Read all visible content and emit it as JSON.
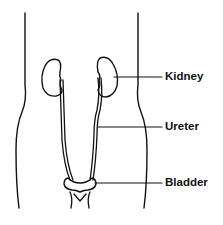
{
  "diagram": {
    "labels": [
      {
        "id": "kidney",
        "text": "Kidney"
      },
      {
        "id": "ureter",
        "text": "Ureter"
      },
      {
        "id": "bladder",
        "text": "Bladder"
      }
    ],
    "colors": {
      "stroke": "#111111",
      "background": "#ffffff"
    }
  }
}
